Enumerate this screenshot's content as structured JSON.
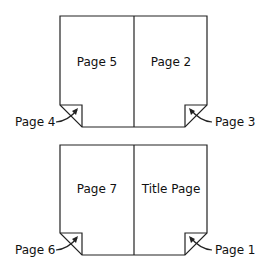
{
  "diagram": {
    "sheets": [
      {
        "name": "top-sheet",
        "left_panel": "Page 5",
        "right_panel": "Page 2",
        "left_corner_label": "Page 4",
        "right_corner_label": "Page 3"
      },
      {
        "name": "bottom-sheet",
        "left_panel": "Page 7",
        "right_panel": "Title Page",
        "left_corner_label": "Page 6",
        "right_corner_label": "Page 1"
      }
    ]
  }
}
